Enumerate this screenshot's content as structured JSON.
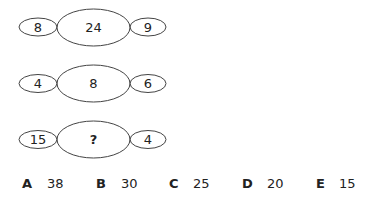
{
  "puzzle": {
    "rows": [
      {
        "left": "8",
        "center": "24",
        "right": "9"
      },
      {
        "left": "4",
        "center": "8",
        "right": "6"
      },
      {
        "left": "15",
        "center": "?",
        "right": "4"
      }
    ]
  },
  "options": [
    {
      "letter": "A",
      "value": "38"
    },
    {
      "letter": "B",
      "value": "30"
    },
    {
      "letter": "C",
      "value": "25"
    },
    {
      "letter": "D",
      "value": "20"
    },
    {
      "letter": "E",
      "value": "15"
    }
  ],
  "colors": {
    "stroke": "#444444",
    "text": "#222222",
    "background": "#ffffff"
  }
}
